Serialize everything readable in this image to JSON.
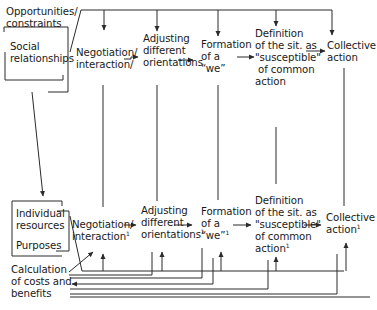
{
  "diagram": {
    "top_row": {
      "left_context": {
        "line1": "Opportunities/",
        "line2": "constraints",
        "line3": "Social",
        "line4": "relationships"
      },
      "nodes": [
        {
          "id": "negotiation",
          "lines": [
            "Negotiation/",
            "interaction/"
          ]
        },
        {
          "id": "adjusting",
          "lines": [
            "Adjusting",
            "different",
            "orientations"
          ]
        },
        {
          "id": "formation",
          "lines": [
            "Formation",
            "of a",
            "“we”"
          ]
        },
        {
          "id": "definition",
          "lines": [
            "Definition",
            "of the sit. as",
            "\"susceptible\"",
            "of common",
            "action"
          ]
        },
        {
          "id": "collective",
          "lines": [
            "Collective",
            "action"
          ]
        }
      ]
    },
    "bottom_row": {
      "left_context": {
        "line1": "Individual",
        "line2": "resources",
        "line3": "Purposes"
      },
      "nodes": [
        {
          "id": "negotiation",
          "lines": [
            "Negotiation/",
            "interaction"
          ],
          "sup": "1"
        },
        {
          "id": "adjusting",
          "lines": [
            "Adjusting",
            "different",
            "orientations"
          ],
          "sup": "1"
        },
        {
          "id": "formation",
          "lines": [
            "Formation",
            "of a",
            "“we”"
          ],
          "sup": "1"
        },
        {
          "id": "definition",
          "lines": [
            "Definition",
            "of the sit. as",
            "\"susceptible\"",
            "of common",
            "action"
          ],
          "sup": "1"
        },
        {
          "id": "collective",
          "lines": [
            "Collective",
            "action"
          ],
          "sup": "1"
        }
      ],
      "calculation": {
        "line1": "Calculation",
        "line2": "of costs and",
        "line3": "benefits"
      }
    },
    "colors": {
      "line": "#2a2a2a",
      "text": "#1a1a1a",
      "background": "#ffffff"
    }
  }
}
